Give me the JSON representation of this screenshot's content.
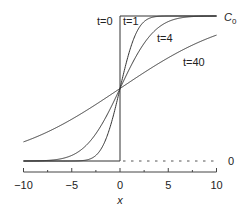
{
  "chart_data": {
    "type": "line",
    "title": "",
    "xlabel": "x",
    "ylabel": "",
    "xlim": [
      -10,
      10
    ],
    "ylim": [
      0,
      1
    ],
    "grid": false,
    "x_ticks": [
      -10,
      -5,
      0,
      5,
      10
    ],
    "x_tick_labels": [
      "−10",
      "−5",
      "0",
      "5",
      "10"
    ],
    "x_minor_ticks": [
      -7.5,
      -2.5,
      2.5,
      7.5
    ],
    "y_reference_labels": {
      "top": "C0",
      "bottom": "0"
    },
    "top_label_main": "C",
    "top_label_sub": "0",
    "bottom_label": "0",
    "x": [
      -10,
      -8,
      -6,
      -5,
      -4,
      -3,
      -2,
      -1.5,
      -1,
      -0.5,
      0,
      0.5,
      1,
      1.5,
      2,
      3,
      4,
      5,
      6,
      8,
      10
    ],
    "series": [
      {
        "name": "t=0",
        "label": "t=0",
        "values": [
          0,
          0,
          0,
          0,
          0,
          0,
          0,
          0,
          0,
          0,
          0.5,
          1,
          1,
          1,
          1,
          1,
          1,
          1,
          1,
          1,
          1
        ],
        "note": "step function at x=0"
      },
      {
        "name": "t=1",
        "label": "t=1",
        "values": [
          0.0,
          0.0,
          0.0,
          0.0002,
          0.0023,
          0.017,
          0.079,
          0.144,
          0.24,
          0.362,
          0.5,
          0.638,
          0.76,
          0.856,
          0.921,
          0.983,
          0.998,
          0.9998,
          1.0,
          1.0,
          1.0
        ]
      },
      {
        "name": "t=4",
        "label": "t=4",
        "values": [
          0.0002,
          0.0023,
          0.017,
          0.039,
          0.079,
          0.144,
          0.24,
          0.298,
          0.362,
          0.43,
          0.5,
          0.57,
          0.638,
          0.702,
          0.76,
          0.856,
          0.921,
          0.961,
          0.983,
          0.998,
          0.9998
        ]
      },
      {
        "name": "t=40",
        "label": "t=40",
        "values": [
          0.132,
          0.186,
          0.251,
          0.288,
          0.327,
          0.369,
          0.412,
          0.434,
          0.456,
          0.478,
          0.5,
          0.522,
          0.544,
          0.566,
          0.588,
          0.631,
          0.673,
          0.712,
          0.749,
          0.814,
          0.868
        ]
      }
    ],
    "annotations": [
      {
        "text": "t=0",
        "near": "left of step at x=0, top"
      },
      {
        "text": "t=1",
        "near": "right of step at x=0, top"
      },
      {
        "text": "t=4",
        "near": "x≈4, upper"
      },
      {
        "text": "t=40",
        "near": "x≈6, middle-upper"
      },
      {
        "text": "C0",
        "near": "right end of top plateau"
      },
      {
        "text": "0",
        "near": "right end of dashed baseline"
      }
    ],
    "baseline_dashed_right": true
  }
}
